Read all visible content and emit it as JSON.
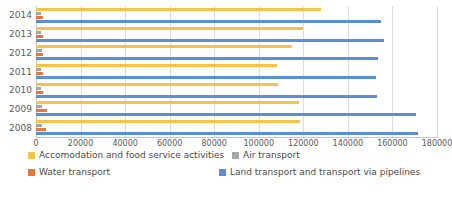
{
  "chart_data": {
    "type": "bar",
    "orientation": "horizontal",
    "title": "",
    "xlabel": "",
    "ylabel": "",
    "categories": [
      "2014",
      "2013",
      "2012",
      "2011",
      "2010",
      "2009",
      "2008"
    ],
    "xlim": [
      0,
      180000
    ],
    "xticks": [
      0,
      20000,
      40000,
      60000,
      80000,
      100000,
      120000,
      140000,
      160000,
      180000
    ],
    "xtick_labels": [
      "0",
      "20000",
      "40000",
      "60000",
      "80000",
      "100000",
      "120000",
      "140000",
      "160000",
      "180000"
    ],
    "grid": true,
    "grid_axis": "x",
    "legend_position": "bottom",
    "series": [
      {
        "name": "Accomodation and food service activities",
        "color": "#f5c24a",
        "values": [
          128000,
          120000,
          115000,
          108000,
          108500,
          118000,
          118500
        ]
      },
      {
        "name": "Air transport",
        "color": "#a6a6a6",
        "values": [
          2400,
          2400,
          2500,
          2400,
          2400,
          2600,
          2700
        ]
      },
      {
        "name": "Water transport",
        "color": "#e8743b",
        "values": [
          3000,
          3100,
          3200,
          3100,
          3200,
          4900,
          4600
        ]
      },
      {
        "name": "Land transport and transport via pipelines",
        "color": "#5b8fd4",
        "values": [
          155000,
          156000,
          153500,
          152500,
          153000,
          170500,
          171500
        ]
      }
    ]
  },
  "legend": {
    "items": [
      {
        "label": "Accomodation and food service activities",
        "color": "#f5c24a"
      },
      {
        "label": "Air transport",
        "color": "#a6a6a6"
      },
      {
        "label": "Water transport",
        "color": "#e8743b"
      },
      {
        "label": "Land transport and transport via pipelines",
        "color": "#5b8fd4"
      }
    ]
  }
}
